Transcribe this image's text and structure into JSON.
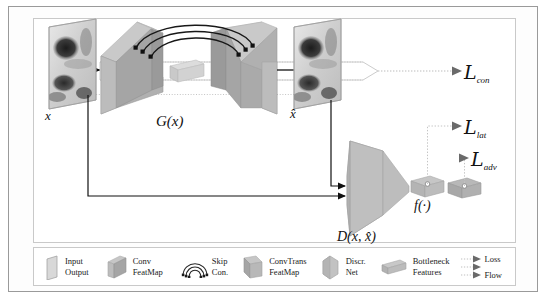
{
  "figure": {
    "type": "architecture-diagram",
    "background": "#ffffff",
    "frame_color": "#9a9a9a"
  },
  "labels": {
    "input": "x",
    "output": "x̂",
    "generator": "G(x)",
    "discriminator": "D(x, x̂)",
    "feature_extractor": "f(·)"
  },
  "losses": [
    {
      "id": "con",
      "name": "L",
      "sub": "con",
      "y": 71
    },
    {
      "id": "lat",
      "name": "L",
      "sub": "lat",
      "y": 126
    },
    {
      "id": "adv",
      "name": "L",
      "sub": "adv",
      "y": 158
    }
  ],
  "legend": {
    "items": [
      {
        "id": "input-output",
        "icon": "parallelogram-plane-icon",
        "line1": "Input",
        "line2": "Output",
        "color": "#d2d2d2"
      },
      {
        "id": "conv-featmap",
        "icon": "conv-trapezoid-icon",
        "line1": "Conv",
        "line2": "FeatMap",
        "color": "#a8a8a8"
      },
      {
        "id": "skip-con",
        "icon": "skip-arcs-icon",
        "line1": "Skip",
        "line2": "Con.",
        "color": "#333333"
      },
      {
        "id": "convtrans-featmap",
        "icon": "convtrans-trapezoid-icon",
        "line1": "ConvTrans",
        "line2": "FeatMap",
        "color": "#a8a8a8"
      },
      {
        "id": "discr-net",
        "icon": "discriminator-trapezoid-icon",
        "line1": "Discr.",
        "line2": "Net",
        "color": "#bdbdbd"
      },
      {
        "id": "bottleneck-features",
        "icon": "bottleneck-box-icon",
        "line1": "Bottleneck",
        "line2": "Features",
        "color": "#b8b8b8"
      },
      {
        "id": "flow-arrows",
        "icon": "dotted-arrow-icon",
        "line1": "Loss",
        "line2": "",
        "line3": "Flow",
        "color": "#707070"
      }
    ]
  },
  "colors": {
    "conv_face": "#aeaeae",
    "conv_top": "#c6c6c6",
    "conv_side": "#949494",
    "bottleneck": "#cfcfcf",
    "discr_face": "#bcbcbc",
    "plane": "#dadada",
    "arrow_black": "#111111",
    "dotted_gray": "#b0b0b0",
    "loss_arrow": "#6a6a6a"
  },
  "skip_connections": {
    "count": 3,
    "description": "Three nested arcs linking encoder feature maps to decoder feature maps"
  },
  "flows": [
    {
      "id": "x-to-generator",
      "from": "x",
      "to": "G(x)",
      "style": "solid-black"
    },
    {
      "id": "generator-to-xhat",
      "from": "G(x)",
      "to": "x̂",
      "style": "solid-black"
    },
    {
      "id": "x-to-discriminator",
      "from": "x",
      "to": "D(x, x̂)",
      "style": "solid-black"
    },
    {
      "id": "xhat-to-discriminator",
      "from": "x̂",
      "to": "D(x, x̂)",
      "style": "solid-black"
    },
    {
      "id": "x-xhat-to-lcon",
      "from": "x and x̂",
      "to": "L_con",
      "style": "dotted-gray"
    },
    {
      "id": "features-to-llat",
      "from": "f(·)",
      "to": "L_lat",
      "style": "dotted-gray"
    },
    {
      "id": "features-to-ladv",
      "from": "f(·)",
      "to": "L_adv",
      "style": "dotted-gray"
    }
  ]
}
